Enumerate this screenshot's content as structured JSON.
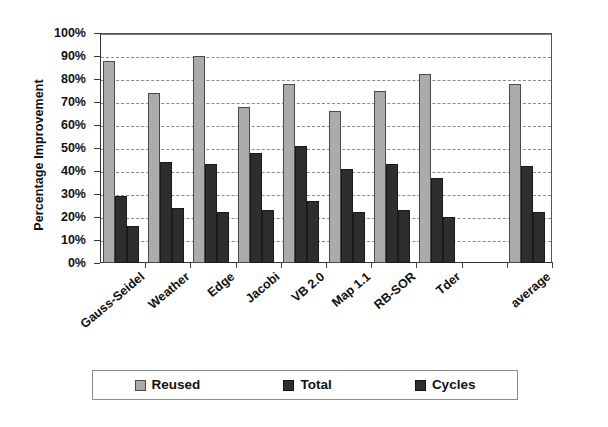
{
  "chart_data": {
    "type": "bar",
    "title": "",
    "xlabel": "",
    "ylabel": "Percentage Improvement",
    "ylim": [
      0,
      100
    ],
    "grid": true,
    "legend_position": "bottom",
    "ytick_labels": [
      "100%",
      "90%",
      "80%",
      "70%",
      "60%",
      "50%",
      "40%",
      "30%",
      "20%",
      "10%",
      "0%"
    ],
    "ytick_values": [
      100,
      90,
      80,
      70,
      60,
      50,
      40,
      30,
      20,
      10,
      0
    ],
    "categories": [
      "Gauss-Seidel",
      "Weather",
      "Edge",
      "Jacobi",
      "VB 2.0",
      "Map 1.1",
      "RB-SOR",
      "Tder",
      "",
      "average"
    ],
    "series": [
      {
        "name": "Reused",
        "color": "#ababab",
        "values": [
          88,
          74,
          90,
          68,
          78,
          66,
          75,
          82,
          null,
          78
        ]
      },
      {
        "name": "Total",
        "color": "#2e2e2e",
        "values": [
          29,
          44,
          43,
          48,
          51,
          41,
          43,
          37,
          null,
          42
        ]
      },
      {
        "name": "Cycles",
        "color": "#2e2e2e",
        "values": [
          16,
          24,
          22,
          23,
          27,
          22,
          23,
          20,
          null,
          22
        ]
      }
    ]
  },
  "legend": {
    "items": [
      {
        "label": "Reused",
        "swatch": "reused"
      },
      {
        "label": "Total",
        "swatch": "total"
      },
      {
        "label": "Cycles",
        "swatch": "cycles"
      }
    ]
  }
}
